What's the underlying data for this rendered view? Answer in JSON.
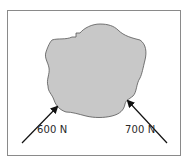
{
  "diagram": {
    "object": {
      "fill": "#c8c8c8",
      "stroke": "#555555"
    },
    "forces": [
      {
        "label": "600 N",
        "direction": "up-right",
        "color": "#111111"
      },
      {
        "label": "700 N",
        "direction": "up-left",
        "color": "#111111"
      }
    ]
  }
}
